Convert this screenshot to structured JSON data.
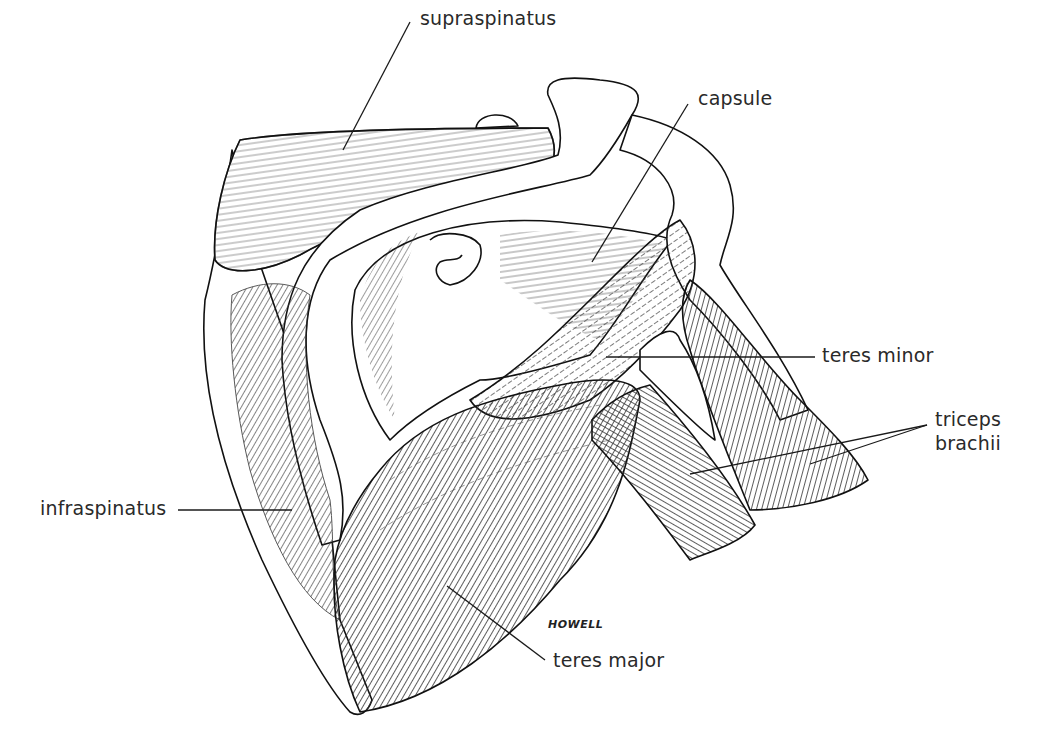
{
  "figure": {
    "signature": "HOWELL"
  },
  "labels": [
    {
      "id": "supraspinatus",
      "text": "supraspinatus",
      "x": 420,
      "y": 6,
      "leader": [
        [
          410,
          22
        ],
        [
          343,
          150
        ]
      ]
    },
    {
      "id": "capsule",
      "text": "capsule",
      "x": 698,
      "y": 86,
      "leader": [
        [
          688,
          104
        ],
        [
          592,
          262
        ]
      ]
    },
    {
      "id": "teres-minor",
      "text": "teres minor",
      "x": 822,
      "y": 343,
      "leader": [
        [
          815,
          357
        ],
        [
          606,
          357
        ]
      ]
    },
    {
      "id": "triceps-brachii",
      "text": "triceps\nbrachii",
      "x": 935,
      "y": 407,
      "leader": [
        [
          927,
          425
        ],
        [
          690,
          474
        ]
      ],
      "leader2": [
        [
          927,
          425
        ],
        [
          810,
          464
        ]
      ]
    },
    {
      "id": "infraspinatus",
      "text": "infraspinatus",
      "x": 40,
      "y": 496,
      "leader": [
        [
          178,
          510
        ],
        [
          292,
          510
        ]
      ]
    },
    {
      "id": "teres-major",
      "text": "teres major",
      "x": 553,
      "y": 648,
      "leader": [
        [
          545,
          660
        ],
        [
          447,
          586
        ]
      ]
    }
  ]
}
